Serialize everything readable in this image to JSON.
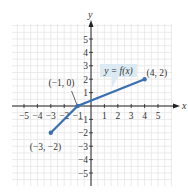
{
  "chart_data": {
    "type": "line",
    "title": "",
    "xlabel": "x",
    "ylabel": "y",
    "xlim": [
      -5.5,
      6
    ],
    "ylim": [
      -6,
      6.5
    ],
    "grid": true,
    "x_ticks": [
      -5,
      -4,
      -3,
      -2,
      -1,
      1,
      2,
      3,
      4,
      5
    ],
    "x_tick_labels": [
      "−5",
      "−4",
      "−3",
      "−2",
      "−1",
      "1",
      "2",
      "3",
      "4",
      "5"
    ],
    "y_ticks": [
      5,
      4,
      3,
      2,
      1,
      -1,
      -2,
      -3,
      -4,
      -5
    ],
    "y_tick_labels": [
      "5",
      "4",
      "3",
      "2",
      "1",
      "−1",
      "−2",
      "−3",
      "−4",
      "−5"
    ],
    "series": [
      {
        "name": "y = f(x)",
        "x": [
          -3,
          -1,
          4
        ],
        "y": [
          -2,
          0,
          2
        ],
        "color": "#3a6fb0"
      }
    ],
    "points": [
      {
        "x": -3,
        "y": -2,
        "label": "(−3, −2)"
      },
      {
        "x": -1,
        "y": 0,
        "label": "(−1, 0)"
      },
      {
        "x": 4,
        "y": 2,
        "label": "(4, 2)"
      }
    ],
    "annotations": [
      {
        "text": "y = f(x)",
        "style": "callout",
        "x": 1.5,
        "y": 2.6
      }
    ]
  },
  "colors": {
    "line": "#3a6fb0",
    "grid": "#e3e3e3",
    "axis": "#222222",
    "callout_bg": "#dcebf3"
  },
  "labels": {
    "x_axis": "x",
    "y_axis": "y",
    "callout": "y = f(x)",
    "point_a": "(−3, −2)",
    "point_b": "(−1, 0)",
    "point_c": "(4, 2)"
  }
}
